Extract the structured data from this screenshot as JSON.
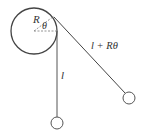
{
  "diagram": {
    "type": "pendulum-wrapping-cylinder",
    "colors": {
      "stroke": "#444444",
      "dashed": "#888888",
      "text": "#333333",
      "background": "#ffffff"
    },
    "cylinder": {
      "center": [
        34,
        31
      ],
      "radius": 23
    },
    "labels": {
      "radius": "R",
      "angle": "θ",
      "vertical_length": "l",
      "diagonal_length": "l + Rθ"
    },
    "strings": {
      "vertical": {
        "from": [
          57,
          31
        ],
        "to": [
          57,
          117
        ]
      },
      "diagonal": {
        "from": [
          54,
          17
        ],
        "to": [
          125,
          93
        ]
      }
    },
    "bobs": [
      {
        "name": "vertical-bob",
        "center": [
          57,
          123
        ],
        "radius": 6
      },
      {
        "name": "swung-bob",
        "center": [
          129,
          98
        ],
        "radius": 6
      }
    ]
  }
}
